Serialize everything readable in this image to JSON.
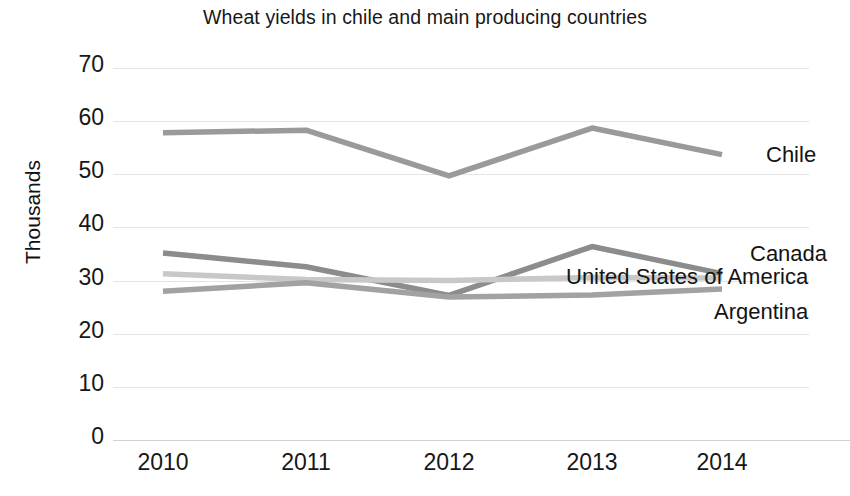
{
  "chart_data": {
    "type": "line",
    "title": "Wheat yields in chile and main producing countries",
    "xlabel": "",
    "ylabel": "Thousands",
    "categories": [
      "2010",
      "2011",
      "2012",
      "2013",
      "2014"
    ],
    "x": [
      2010,
      2011,
      2012,
      2013,
      2014
    ],
    "ylim": [
      0,
      70
    ],
    "yticks": [
      "0",
      "10",
      "20",
      "30",
      "40",
      "50",
      "60",
      "70"
    ],
    "ytick_values": [
      0,
      10,
      20,
      30,
      40,
      50,
      60,
      70
    ],
    "grid": true,
    "legend_position": "right-inline-labels",
    "series": [
      {
        "name": "Chile",
        "values": [
          57.8,
          58.3,
          49.7,
          58.7,
          53.7
        ],
        "color": "#9a9a9a",
        "label_y": 53.7
      },
      {
        "name": "Canada",
        "values": [
          35.2,
          32.6,
          27.2,
          36.4,
          31.3
        ],
        "color": "#8c8c8c",
        "label_y": 35.0
      },
      {
        "name": "United States of America",
        "values": [
          31.3,
          30.2,
          30.0,
          30.6,
          30.5
        ],
        "color": "#c8c8c8",
        "label_y": 30.6
      },
      {
        "name": "Argentina",
        "values": [
          28.0,
          29.6,
          26.9,
          27.3,
          28.4
        ],
        "color": "#a2a2a2",
        "label_y": 24.0
      }
    ]
  },
  "axis": {
    "y_title": "Thousands",
    "ticks_y": [
      "70",
      "60",
      "50",
      "40",
      "30",
      "20",
      "10",
      "0"
    ],
    "ticks_x": [
      "2010",
      "2011",
      "2012",
      "2013",
      "2014"
    ]
  },
  "labels": {
    "chile": "Chile",
    "canada": "Canada",
    "usa": "United States of America",
    "argentina": "Argentina"
  },
  "colors": {
    "chile": "#9a9a9a",
    "canada": "#8c8c8c",
    "usa": "#c8c8c8",
    "argentina": "#a2a2a2",
    "grid": "#e4e4e8",
    "text": "#171717",
    "background": "#ffffff"
  }
}
